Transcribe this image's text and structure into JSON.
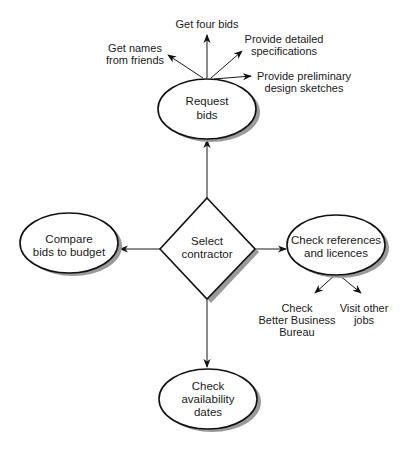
{
  "diagram": {
    "type": "mind-map / decision diagram",
    "center": {
      "id": "select",
      "shape": "diamond",
      "lines": [
        "Select",
        "contractor"
      ]
    },
    "nodes": [
      {
        "id": "request",
        "shape": "ellipse",
        "lines": [
          "Request",
          "bids"
        ]
      },
      {
        "id": "compare",
        "shape": "ellipse",
        "lines": [
          "Compare",
          "bids to budget"
        ]
      },
      {
        "id": "references",
        "shape": "ellipse",
        "lines": [
          "Check references",
          "and licences"
        ]
      },
      {
        "id": "availability",
        "shape": "ellipse",
        "lines": [
          "Check",
          "availability",
          "dates"
        ]
      }
    ],
    "leaves": [
      {
        "id": "names",
        "parent": "request",
        "lines": [
          "Get names",
          "from friends"
        ]
      },
      {
        "id": "four",
        "parent": "request",
        "lines": [
          "Get four bids"
        ]
      },
      {
        "id": "specs",
        "parent": "request",
        "lines": [
          "Provide detailed",
          "specifications"
        ]
      },
      {
        "id": "sketches",
        "parent": "request",
        "lines": [
          "Provide preliminary",
          "design sketches"
        ]
      },
      {
        "id": "bbb",
        "parent": "references",
        "lines": [
          "Check",
          "Better Business",
          "Bureau"
        ]
      },
      {
        "id": "visit",
        "parent": "references",
        "lines": [
          "Visit other",
          "jobs"
        ]
      }
    ],
    "edges": [
      {
        "from": "select",
        "to": "request"
      },
      {
        "from": "select",
        "to": "compare"
      },
      {
        "from": "select",
        "to": "references"
      },
      {
        "from": "select",
        "to": "availability"
      },
      {
        "from": "request",
        "to": "names"
      },
      {
        "from": "request",
        "to": "four"
      },
      {
        "from": "request",
        "to": "specs"
      },
      {
        "from": "request",
        "to": "sketches"
      },
      {
        "from": "references",
        "to": "bbb"
      },
      {
        "from": "references",
        "to": "visit"
      }
    ]
  }
}
